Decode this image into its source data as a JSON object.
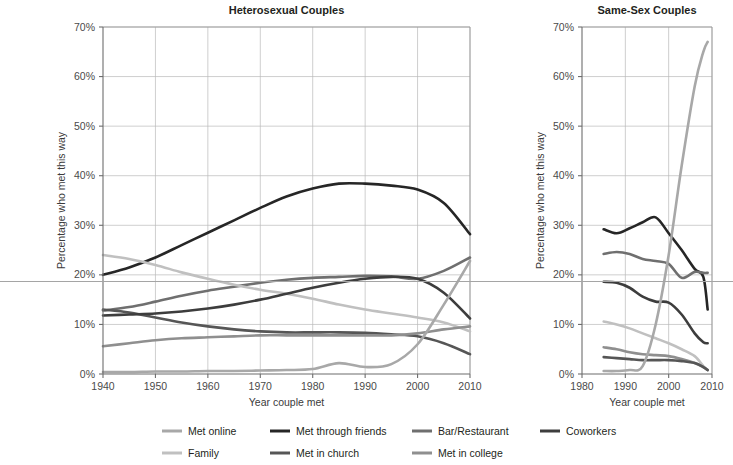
{
  "figure": {
    "width": 733,
    "height": 465,
    "background": "#ffffff"
  },
  "panels": [
    {
      "id": "heterosexual",
      "title": "Heterosexual Couples",
      "xlabel": "Year couple met",
      "ylabel": "Percentage who met this way",
      "xticks": [
        "1940",
        "1950",
        "1960",
        "1970",
        "1980",
        "1990",
        "2000",
        "2010"
      ],
      "yticks": [
        "0%",
        "10%",
        "20%",
        "30%",
        "40%",
        "50%",
        "60%",
        "70%"
      ]
    },
    {
      "id": "same-sex",
      "title": "Same-Sex Couples",
      "xlabel": "Year couple met",
      "ylabel": "Percentage who met this way",
      "xticks": [
        "1980",
        "1990",
        "2000",
        "2010"
      ],
      "yticks": [
        "0%",
        "10%",
        "20%",
        "30%",
        "40%",
        "50%",
        "60%",
        "70%"
      ]
    }
  ],
  "legend": {
    "rows": [
      [
        {
          "label": "Met online",
          "color": "#a8a8a8"
        },
        {
          "label": "Met through friends",
          "color": "#262626"
        },
        {
          "label": "Bar/Restaurant",
          "color": "#6f6f6f"
        },
        {
          "label": "Coworkers",
          "color": "#3d3d3d"
        }
      ],
      [
        {
          "label": "Family",
          "color": "#c0c0c0"
        },
        {
          "label": "Met in church",
          "color": "#565656"
        },
        {
          "label": "Met in college",
          "color": "#8f8f8f"
        }
      ]
    ]
  },
  "colors": {
    "met_online": "#a8a8a8",
    "met_through_friends": "#262626",
    "bar_restaurant": "#6f6f6f",
    "coworkers": "#3d3d3d",
    "family": "#c0c0c0",
    "met_in_church": "#565656",
    "met_in_college": "#8f8f8f",
    "grid": "#b9b9b9",
    "frame": "#9a9a9a",
    "axis": "#6d6d6d",
    "text": "#231f20"
  },
  "chart_data": [
    {
      "type": "line",
      "title": "Heterosexual Couples",
      "xlabel": "Year couple met",
      "ylabel": "Percentage who met this way",
      "xlim": [
        1940,
        2010
      ],
      "ylim": [
        0,
        70
      ],
      "xticks": [
        1940,
        1950,
        1960,
        1970,
        1980,
        1990,
        2000,
        2010
      ],
      "yticks": [
        0,
        10,
        20,
        30,
        40,
        50,
        60,
        70
      ],
      "grid": true,
      "legend": "bottom",
      "x": [
        1940,
        1945,
        1950,
        1955,
        1960,
        1965,
        1970,
        1975,
        1980,
        1985,
        1990,
        1995,
        2000,
        2005,
        2010
      ],
      "series": [
        {
          "name": "Met through friends",
          "color": "#262626",
          "values": [
            20.0,
            21.5,
            23.5,
            26.0,
            28.5,
            31.0,
            33.5,
            35.8,
            37.4,
            38.4,
            38.4,
            38.0,
            37.2,
            34.5,
            28.2
          ]
        },
        {
          "name": "Bar/Restaurant",
          "color": "#6f6f6f",
          "values": [
            12.8,
            13.5,
            14.6,
            15.8,
            16.8,
            17.6,
            18.4,
            19.0,
            19.4,
            19.6,
            19.8,
            19.7,
            19.2,
            20.8,
            23.5
          ]
        },
        {
          "name": "Family",
          "color": "#c0c0c0",
          "values": [
            24.0,
            23.2,
            22.0,
            20.5,
            19.2,
            18.0,
            17.0,
            16.2,
            15.2,
            14.0,
            13.0,
            12.2,
            11.4,
            10.4,
            8.6
          ]
        },
        {
          "name": "Met in church",
          "color": "#565656",
          "values": [
            13.0,
            12.4,
            11.4,
            10.4,
            9.6,
            9.0,
            8.6,
            8.4,
            8.4,
            8.4,
            8.3,
            8.0,
            7.6,
            6.2,
            4.0
          ]
        },
        {
          "name": "Coworkers",
          "color": "#3d3d3d",
          "values": [
            11.8,
            12.0,
            12.2,
            12.6,
            13.2,
            14.0,
            15.0,
            16.2,
            17.4,
            18.4,
            19.2,
            19.6,
            19.2,
            16.4,
            11.2
          ]
        },
        {
          "name": "Met in college",
          "color": "#8f8f8f",
          "values": [
            5.6,
            6.2,
            6.8,
            7.2,
            7.4,
            7.6,
            7.8,
            7.8,
            7.8,
            7.8,
            7.8,
            7.8,
            8.2,
            9.0,
            9.6
          ]
        },
        {
          "name": "Met online",
          "color": "#a8a8a8",
          "values": [
            0.4,
            0.4,
            0.5,
            0.5,
            0.6,
            0.6,
            0.7,
            0.8,
            1.0,
            2.2,
            1.4,
            2.0,
            6.0,
            14.0,
            22.8
          ]
        }
      ]
    },
    {
      "type": "line",
      "title": "Same-Sex Couples",
      "xlabel": "Year couple met",
      "ylabel": "Percentage who met this way",
      "xlim": [
        1980,
        2010
      ],
      "ylim": [
        0,
        70
      ],
      "xticks": [
        1980,
        1990,
        2000,
        2010
      ],
      "yticks": [
        0,
        10,
        20,
        30,
        40,
        50,
        60,
        70
      ],
      "grid": true,
      "legend": "bottom",
      "x": [
        1985,
        1988,
        1991,
        1994,
        1997,
        2000,
        2003,
        2006,
        2008,
        2009
      ],
      "series": [
        {
          "name": "Met through friends",
          "color": "#262626",
          "values": [
            29.2,
            28.4,
            29.4,
            30.6,
            31.6,
            28.4,
            25.0,
            21.2,
            19.6,
            13.0
          ]
        },
        {
          "name": "Bar/Restaurant",
          "color": "#6f6f6f",
          "values": [
            24.2,
            24.6,
            24.2,
            23.2,
            22.8,
            22.2,
            19.4,
            20.6,
            20.4,
            20.4
          ]
        },
        {
          "name": "Coworkers",
          "color": "#3d3d3d",
          "values": [
            18.6,
            18.4,
            17.4,
            15.6,
            14.6,
            14.4,
            12.0,
            8.2,
            6.4,
            6.2
          ]
        },
        {
          "name": "Family",
          "color": "#c0c0c0",
          "values": [
            10.6,
            10.0,
            9.2,
            8.2,
            7.2,
            6.2,
            5.0,
            3.6,
            1.6,
            0.8
          ]
        },
        {
          "name": "Met in college",
          "color": "#8f8f8f",
          "values": [
            5.4,
            5.0,
            4.4,
            4.0,
            3.8,
            3.6,
            3.0,
            2.2,
            1.4,
            0.8
          ]
        },
        {
          "name": "Met in church",
          "color": "#565656",
          "values": [
            3.4,
            3.2,
            3.0,
            2.8,
            2.8,
            2.8,
            2.6,
            2.2,
            1.4,
            0.8
          ]
        },
        {
          "name": "Met online",
          "color": "#a8a8a8",
          "values": [
            0.6,
            0.6,
            0.8,
            1.6,
            10.0,
            24.0,
            42.0,
            58.0,
            65.0,
            67.0
          ]
        }
      ]
    }
  ]
}
